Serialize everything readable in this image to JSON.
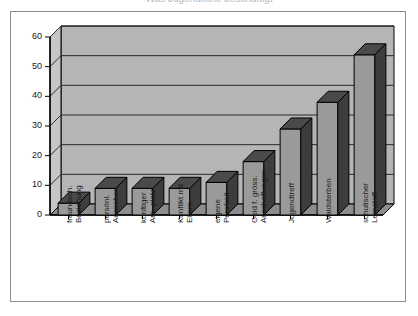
{
  "title": "Was Jugendliche beschäftigt",
  "chart_data": {
    "type": "bar",
    "title": "",
    "xlabel": "",
    "ylabel": "",
    "ylim": [
      0,
      60
    ],
    "yticks": [
      0,
      10,
      20,
      30,
      40,
      50,
      60
    ],
    "ytick_labels": [
      "0",
      "10",
      "20",
      "30",
      "40",
      "50",
      "60"
    ],
    "grid": true,
    "legend": false,
    "style": "3d-column",
    "categories": [
      "freundsch. Beziehung",
      "persönl. Aussehen",
      "künftiger Arb.-platz",
      "Konflikt mit Eltern",
      "eigene Pers'keit",
      "Geld f. gröss. Anschaffungen",
      "Jugendtreff",
      "Waldsterben",
      "schulischer Lernstoff"
    ],
    "category_lines": [
      [
        "freundsch.",
        "Beziehung"
      ],
      [
        "persönl.",
        "Aussehen"
      ],
      [
        "künftiger",
        "Arb.-platz"
      ],
      [
        "Konflikt mit",
        "Eltern"
      ],
      [
        "eigene",
        "Pers'keit"
      ],
      [
        "Geld f. gröss.",
        "Anschaffungen"
      ],
      [
        "Jugendtreff",
        ""
      ],
      [
        "Waldsterben",
        ""
      ],
      [
        "schulischer",
        "Lernstoff"
      ]
    ],
    "values": [
      4,
      9,
      9,
      9,
      11,
      18,
      29,
      38,
      54
    ]
  },
  "colors": {
    "bar_front": "#9a9a9a",
    "bar_side": "#3d3d3d",
    "bar_top": "#4a4a4a",
    "plot_background": "#b5b5b5",
    "wall_side": "#c6c6c6",
    "floor": "#8d8d8d",
    "gridline": "#2b2b2b",
    "axis": "#000000",
    "frame_border": "#8e8e8e",
    "text": "#1a1a1a"
  }
}
